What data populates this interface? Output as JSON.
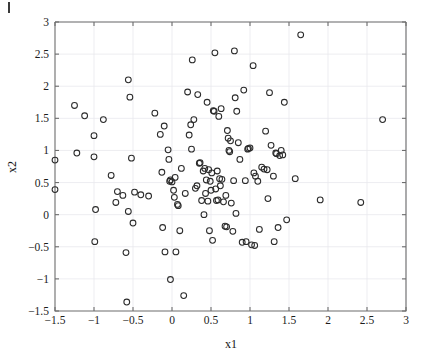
{
  "figure": {
    "background_color": "#ffffff",
    "marker_color": "#2b2b2b",
    "grid_color": "#e9e9ee",
    "axis_color": "#6d6d6d",
    "page_mark": "page-edge-artifact"
  },
  "chart_data": {
    "type": "scatter",
    "title": "",
    "xlabel": "x1",
    "ylabel": "x2",
    "xlim": [
      -1.5,
      3
    ],
    "ylim": [
      -1.5,
      3
    ],
    "xticks": [
      -1.5,
      -1,
      -0.5,
      0,
      0.5,
      1,
      1.5,
      2,
      2.5,
      3
    ],
    "xtick_labels": [
      "−1.5",
      "−1",
      "−0.5",
      "0",
      "0.5",
      "1",
      "1.5",
      "2",
      "2.5",
      "3"
    ],
    "yticks": [
      -1.5,
      -1,
      -0.5,
      0,
      0.5,
      1,
      1.5,
      2,
      2.5,
      3
    ],
    "ytick_labels": [
      "−1.5",
      "−1",
      "−0.5",
      "0",
      "0.5",
      "1",
      "1.5",
      "2",
      "2.5",
      "3"
    ],
    "grid": true,
    "legend": null,
    "marker_style": "open-circle",
    "marker_size": 4.2,
    "n_points": 140,
    "points": [
      [
        -1.5,
        0.85
      ],
      [
        -1.5,
        0.39
      ],
      [
        -1.25,
        1.7
      ],
      [
        -1.22,
        0.96
      ],
      [
        -1.12,
        1.54
      ],
      [
        -1.0,
        1.23
      ],
      [
        -1.0,
        0.9
      ],
      [
        -0.99,
        -0.42
      ],
      [
        -0.98,
        0.08
      ],
      [
        -0.88,
        1.48
      ],
      [
        -0.78,
        0.61
      ],
      [
        -0.72,
        0.19
      ],
      [
        -0.7,
        0.36
      ],
      [
        -0.63,
        0.3
      ],
      [
        -0.59,
        -0.59
      ],
      [
        -0.58,
        -1.36
      ],
      [
        -0.56,
        2.1
      ],
      [
        -0.56,
        0.05
      ],
      [
        -0.54,
        1.83
      ],
      [
        -0.52,
        0.88
      ],
      [
        -0.5,
        -0.13
      ],
      [
        -0.48,
        0.35
      ],
      [
        -0.4,
        0.31
      ],
      [
        -0.3,
        0.29
      ],
      [
        -0.22,
        1.58
      ],
      [
        -0.15,
        1.25
      ],
      [
        -0.13,
        0.66
      ],
      [
        -0.12,
        -0.2
      ],
      [
        -0.1,
        1.38
      ],
      [
        -0.09,
        -0.58
      ],
      [
        -0.05,
        1.01
      ],
      [
        -0.04,
        0.86
      ],
      [
        -0.03,
        0.52
      ],
      [
        -0.02,
        0.54
      ],
      [
        -0.02,
        -1.01
      ],
      [
        0.0,
        0.51
      ],
      [
        0.02,
        0.38
      ],
      [
        0.03,
        0.27
      ],
      [
        0.04,
        0.58
      ],
      [
        0.05,
        -0.58
      ],
      [
        0.07,
        0.16
      ],
      [
        0.08,
        0.14
      ],
      [
        0.1,
        -0.25
      ],
      [
        0.12,
        0.72
      ],
      [
        0.15,
        -1.26
      ],
      [
        0.17,
        0.33
      ],
      [
        0.2,
        1.91
      ],
      [
        0.22,
        1.24
      ],
      [
        0.24,
        1.4
      ],
      [
        0.25,
        1.02
      ],
      [
        0.26,
        2.41
      ],
      [
        0.28,
        1.48
      ],
      [
        0.3,
        0.41
      ],
      [
        0.32,
        0.45
      ],
      [
        0.33,
        1.87
      ],
      [
        0.35,
        0.8
      ],
      [
        0.36,
        0.81
      ],
      [
        0.38,
        0.22
      ],
      [
        0.4,
        0.68
      ],
      [
        0.41,
        0.0
      ],
      [
        0.42,
        0.72
      ],
      [
        0.43,
        0.33
      ],
      [
        0.44,
        0.54
      ],
      [
        0.45,
        1.75
      ],
      [
        0.46,
        0.21
      ],
      [
        0.47,
        0.7
      ],
      [
        0.48,
        -0.25
      ],
      [
        0.49,
        0.52
      ],
      [
        0.5,
        0.38
      ],
      [
        0.51,
        0.65
      ],
      [
        0.52,
        -0.4
      ],
      [
        0.53,
        1.62
      ],
      [
        0.54,
        1.61
      ],
      [
        0.55,
        2.52
      ],
      [
        0.56,
        0.4
      ],
      [
        0.57,
        0.22
      ],
      [
        0.58,
        0.68
      ],
      [
        0.59,
        0.23
      ],
      [
        0.6,
        1.53
      ],
      [
        0.61,
        0.56
      ],
      [
        0.62,
        0.45
      ],
      [
        0.63,
        1.65
      ],
      [
        0.64,
        0.55
      ],
      [
        0.66,
        0.2
      ],
      [
        0.68,
        -0.18
      ],
      [
        0.69,
        0.3
      ],
      [
        0.7,
        -0.19
      ],
      [
        0.71,
        1.31
      ],
      [
        0.72,
        1.19
      ],
      [
        0.73,
        1.0
      ],
      [
        0.74,
        0.98
      ],
      [
        0.75,
        1.15
      ],
      [
        0.76,
        0.18
      ],
      [
        0.78,
        -0.26
      ],
      [
        0.79,
        0.53
      ],
      [
        0.8,
        2.55
      ],
      [
        0.81,
        1.82
      ],
      [
        0.82,
        0.02
      ],
      [
        0.83,
        1.61
      ],
      [
        0.85,
        1.12
      ],
      [
        0.87,
        0.86
      ],
      [
        0.9,
        -0.43
      ],
      [
        0.92,
        1.94
      ],
      [
        0.94,
        0.53
      ],
      [
        0.95,
        -0.42
      ],
      [
        0.97,
        1.02
      ],
      [
        0.98,
        1.03
      ],
      [
        1.0,
        1.04
      ],
      [
        1.02,
        -0.47
      ],
      [
        1.04,
        2.32
      ],
      [
        1.05,
        0.65
      ],
      [
        1.06,
        -0.48
      ],
      [
        1.07,
        0.6
      ],
      [
        1.1,
        0.52
      ],
      [
        1.12,
        -0.23
      ],
      [
        1.15,
        0.74
      ],
      [
        1.18,
        0.71
      ],
      [
        1.2,
        1.3
      ],
      [
        1.22,
        0.7
      ],
      [
        1.23,
        0.25
      ],
      [
        1.25,
        1.9
      ],
      [
        1.27,
        1.08
      ],
      [
        1.3,
        0.6
      ],
      [
        1.31,
        -0.42
      ],
      [
        1.33,
        0.96
      ],
      [
        1.34,
        0.95
      ],
      [
        1.36,
        -0.2
      ],
      [
        1.38,
        0.92
      ],
      [
        1.4,
        1.0
      ],
      [
        1.42,
        0.93
      ],
      [
        1.44,
        1.75
      ],
      [
        1.47,
        -0.08
      ],
      [
        1.58,
        0.56
      ],
      [
        1.65,
        2.8
      ],
      [
        1.9,
        0.23
      ],
      [
        2.42,
        0.19
      ],
      [
        2.7,
        1.48
      ]
    ]
  }
}
